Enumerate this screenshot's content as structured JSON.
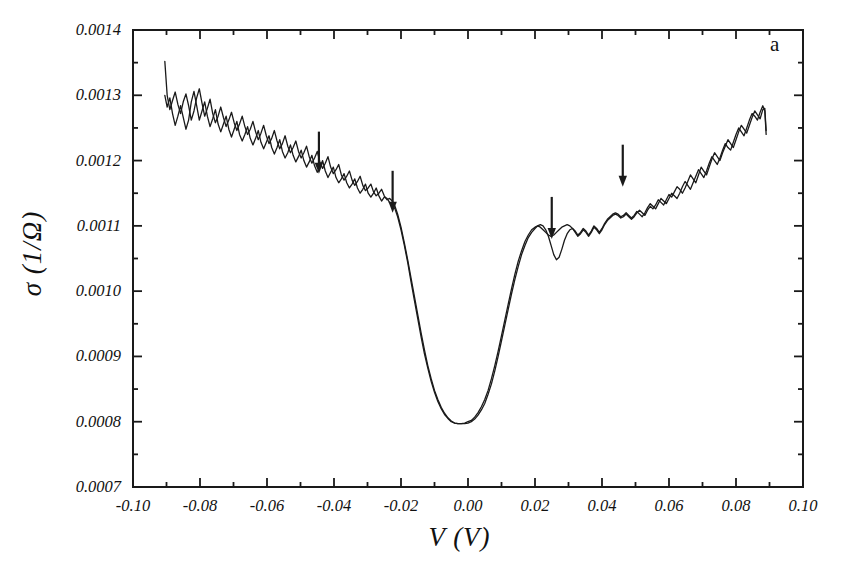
{
  "figure": {
    "panel_id": "a",
    "xlabel": "V (V)",
    "ylabel": "σ (1/Ω)",
    "line_color": "#1a1a1a",
    "background": "#ffffff"
  },
  "axes": {
    "x_ticks": [
      "-0.10",
      "-0.08",
      "-0.06",
      "-0.04",
      "-0.02",
      "0.00",
      "0.02",
      "0.04",
      "0.06",
      "0.08",
      "0.10"
    ],
    "x_tick_values": [
      -0.1,
      -0.08,
      -0.06,
      -0.04,
      -0.02,
      0.0,
      0.02,
      0.04,
      0.06,
      0.08,
      0.1
    ],
    "y_ticks": [
      "0.0007",
      "0.0008",
      "0.0009",
      "0.0010",
      "0.0011",
      "0.0012",
      "0.0013",
      "0.0014"
    ],
    "y_tick_values": [
      0.0007,
      0.0008,
      0.0009,
      0.001,
      0.0011,
      0.0012,
      0.0013,
      0.0014
    ],
    "x_minor_step": 0.01,
    "y_minor_step": 5e-05
  },
  "chart_data": {
    "type": "line",
    "title": "",
    "panel_label": "a",
    "xlabel": "V (V)",
    "ylabel": "σ (1/Ω)",
    "xlim": [
      -0.1,
      0.1
    ],
    "ylim": [
      0.0007,
      0.0014
    ],
    "grid": false,
    "legend": "none",
    "annotations": [
      {
        "type": "arrow",
        "direction": "down",
        "x": -0.0445,
        "y_tip": 0.00118,
        "label": ""
      },
      {
        "type": "arrow",
        "direction": "down",
        "x": -0.0225,
        "y_tip": 0.00112,
        "label": ""
      },
      {
        "type": "arrow",
        "direction": "down",
        "x": 0.025,
        "y_tip": 0.00108,
        "label": ""
      },
      {
        "type": "arrow",
        "direction": "down",
        "x": 0.0462,
        "y_tip": 0.00116,
        "label": ""
      }
    ],
    "series": [
      {
        "name": "trace-1",
        "x": [
          -0.0905,
          -0.0898,
          -0.089,
          -0.0882,
          -0.0874,
          -0.0866,
          -0.0858,
          -0.085,
          -0.0842,
          -0.0834,
          -0.0826,
          -0.0818,
          -0.081,
          -0.0802,
          -0.0794,
          -0.0786,
          -0.0778,
          -0.077,
          -0.0762,
          -0.0754,
          -0.0746,
          -0.0738,
          -0.073,
          -0.0722,
          -0.0714,
          -0.0706,
          -0.0698,
          -0.069,
          -0.0682,
          -0.0674,
          -0.0666,
          -0.0658,
          -0.065,
          -0.0642,
          -0.0634,
          -0.0626,
          -0.0618,
          -0.061,
          -0.0602,
          -0.0594,
          -0.0586,
          -0.0578,
          -0.057,
          -0.0562,
          -0.0554,
          -0.0546,
          -0.0538,
          -0.053,
          -0.0522,
          -0.0514,
          -0.0506,
          -0.0498,
          -0.049,
          -0.0482,
          -0.0474,
          -0.0466,
          -0.0458,
          -0.045,
          -0.0442,
          -0.0434,
          -0.0426,
          -0.0418,
          -0.041,
          -0.0402,
          -0.0394,
          -0.0386,
          -0.0378,
          -0.037,
          -0.0362,
          -0.0354,
          -0.0346,
          -0.0338,
          -0.033,
          -0.0322,
          -0.0314,
          -0.0306,
          -0.0298,
          -0.029,
          -0.0282,
          -0.0274,
          -0.0266,
          -0.0258,
          -0.025,
          -0.0242,
          -0.0234,
          -0.0226,
          -0.0218,
          -0.021,
          -0.02,
          -0.019,
          -0.018,
          -0.017,
          -0.016,
          -0.015,
          -0.014,
          -0.013,
          -0.012,
          -0.011,
          -0.01,
          -0.009,
          -0.008,
          -0.007,
          -0.006,
          -0.005,
          -0.004,
          -0.003,
          -0.002,
          -0.001,
          0.0,
          0.001,
          0.002,
          0.003,
          0.004,
          0.005,
          0.006,
          0.007,
          0.008,
          0.009,
          0.01,
          0.011,
          0.012,
          0.013,
          0.014,
          0.015,
          0.016,
          0.017,
          0.018,
          0.019,
          0.02,
          0.0208,
          0.0216,
          0.0224,
          0.0232,
          0.024,
          0.0248,
          0.0256,
          0.0264,
          0.0272,
          0.028,
          0.0288,
          0.0296,
          0.0304,
          0.0312,
          0.032,
          0.0328,
          0.0336,
          0.0344,
          0.0352,
          0.036,
          0.0368,
          0.0376,
          0.0384,
          0.0392,
          0.04,
          0.0408,
          0.0416,
          0.0424,
          0.0432,
          0.044,
          0.0448,
          0.0456,
          0.0464,
          0.0472,
          0.048,
          0.0488,
          0.0496,
          0.0504,
          0.0512,
          0.052,
          0.0528,
          0.0536,
          0.0544,
          0.0552,
          0.056,
          0.0568,
          0.0576,
          0.0584,
          0.0592,
          0.06,
          0.0608,
          0.0616,
          0.0624,
          0.0632,
          0.064,
          0.0648,
          0.0656,
          0.0664,
          0.0672,
          0.068,
          0.0688,
          0.0696,
          0.0704,
          0.0712,
          0.072,
          0.0728,
          0.0736,
          0.0744,
          0.0752,
          0.076,
          0.0768,
          0.0776,
          0.0784,
          0.0792,
          0.08,
          0.0808,
          0.0816,
          0.0824,
          0.0832,
          0.084,
          0.0848,
          0.0856,
          0.0864,
          0.0872,
          0.088,
          0.0886,
          0.089
        ],
        "y": [
          0.001352,
          0.0013,
          0.001278,
          0.001292,
          0.001305,
          0.001286,
          0.001272,
          0.00129,
          0.001302,
          0.001284,
          0.001262,
          0.001276,
          0.001296,
          0.00131,
          0.001288,
          0.001268,
          0.00128,
          0.001294,
          0.001272,
          0.001258,
          0.001268,
          0.001282,
          0.001266,
          0.001252,
          0.001262,
          0.001274,
          0.001258,
          0.001246,
          0.001256,
          0.001268,
          0.001252,
          0.00124,
          0.001248,
          0.00126,
          0.001244,
          0.001232,
          0.001242,
          0.001254,
          0.001238,
          0.001226,
          0.001234,
          0.001246,
          0.00123,
          0.001218,
          0.001226,
          0.001238,
          0.001222,
          0.001212,
          0.00122,
          0.00123,
          0.001214,
          0.001204,
          0.001212,
          0.001222,
          0.001206,
          0.001196,
          0.001204,
          0.001214,
          0.001198,
          0.001188,
          0.001196,
          0.001206,
          0.00119,
          0.00118,
          0.001186,
          0.001194,
          0.001178,
          0.00117,
          0.001176,
          0.001184,
          0.00117,
          0.001162,
          0.001168,
          0.001176,
          0.001162,
          0.001154,
          0.001158,
          0.001164,
          0.001152,
          0.001146,
          0.00115,
          0.001156,
          0.001146,
          0.00114,
          0.001142,
          0.001138,
          0.00113,
          0.001118,
          0.001098,
          0.001074,
          0.001048,
          0.00102,
          0.000992,
          0.000964,
          0.000936,
          0.00091,
          0.000886,
          0.000866,
          0.000848,
          0.000834,
          0.000822,
          0.000813,
          0.000806,
          0.000801,
          0.000798,
          0.000797,
          0.000797,
          0.000797,
          0.000798,
          0.0008,
          0.000804,
          0.00081,
          0.000818,
          0.000828,
          0.000842,
          0.000858,
          0.000878,
          0.0009,
          0.000924,
          0.000948,
          0.000972,
          0.000996,
          0.001018,
          0.001038,
          0.001056,
          0.00107,
          0.001082,
          0.00109,
          0.001096,
          0.0011,
          0.001102,
          0.0011,
          0.001094,
          0.001084,
          0.00107,
          0.001056,
          0.001048,
          0.001052,
          0.001064,
          0.001078,
          0.001088,
          0.001094,
          0.001096,
          0.001092,
          0.001086,
          0.00109,
          0.001096,
          0.001092,
          0.001086,
          0.001092,
          0.0011,
          0.001096,
          0.00109,
          0.001096,
          0.001104,
          0.00111,
          0.001114,
          0.001118,
          0.00112,
          0.001118,
          0.001114,
          0.001116,
          0.00112,
          0.001116,
          0.001112,
          0.001116,
          0.001122,
          0.001118,
          0.001114,
          0.00112,
          0.001128,
          0.001134,
          0.00113,
          0.001126,
          0.001134,
          0.001142,
          0.001138,
          0.001134,
          0.001142,
          0.00115,
          0.001146,
          0.001142,
          0.00115,
          0.00116,
          0.001168,
          0.001162,
          0.001156,
          0.001166,
          0.001176,
          0.001186,
          0.00118,
          0.001174,
          0.001184,
          0.001196,
          0.001206,
          0.0012,
          0.001194,
          0.001204,
          0.001216,
          0.001226,
          0.00122,
          0.001216,
          0.001228,
          0.00124,
          0.00125,
          0.001244,
          0.001238,
          0.00125,
          0.001262,
          0.001272,
          0.001268,
          0.001262,
          0.001274,
          0.001284,
          0.001276,
          0.00124
        ]
      },
      {
        "name": "trace-2",
        "x": [
          -0.0905,
          -0.0898,
          -0.089,
          -0.0882,
          -0.0874,
          -0.0866,
          -0.0858,
          -0.085,
          -0.0842,
          -0.0834,
          -0.0826,
          -0.0818,
          -0.081,
          -0.0802,
          -0.0794,
          -0.0786,
          -0.0778,
          -0.077,
          -0.0762,
          -0.0754,
          -0.0746,
          -0.0738,
          -0.073,
          -0.0722,
          -0.0714,
          -0.0706,
          -0.0698,
          -0.069,
          -0.0682,
          -0.0674,
          -0.0666,
          -0.0658,
          -0.065,
          -0.0642,
          -0.0634,
          -0.0626,
          -0.0618,
          -0.061,
          -0.0602,
          -0.0594,
          -0.0586,
          -0.0578,
          -0.057,
          -0.0562,
          -0.0554,
          -0.0546,
          -0.0538,
          -0.053,
          -0.0522,
          -0.0514,
          -0.0506,
          -0.0498,
          -0.049,
          -0.0482,
          -0.0474,
          -0.0466,
          -0.0458,
          -0.045,
          -0.0442,
          -0.0434,
          -0.0426,
          -0.0418,
          -0.041,
          -0.0402,
          -0.0394,
          -0.0386,
          -0.0378,
          -0.037,
          -0.0362,
          -0.0354,
          -0.0346,
          -0.0338,
          -0.033,
          -0.0322,
          -0.0314,
          -0.0306,
          -0.0298,
          -0.029,
          -0.0282,
          -0.0274,
          -0.0266,
          -0.0258,
          -0.025,
          -0.0242,
          -0.0234,
          -0.0226,
          -0.0218,
          -0.021,
          -0.02,
          -0.019,
          -0.018,
          -0.017,
          -0.016,
          -0.015,
          -0.014,
          -0.013,
          -0.012,
          -0.011,
          -0.01,
          -0.009,
          -0.008,
          -0.007,
          -0.006,
          -0.005,
          -0.004,
          -0.003,
          -0.002,
          -0.001,
          0.0,
          0.001,
          0.002,
          0.003,
          0.004,
          0.005,
          0.006,
          0.007,
          0.008,
          0.009,
          0.01,
          0.011,
          0.012,
          0.013,
          0.014,
          0.015,
          0.016,
          0.017,
          0.018,
          0.019,
          0.02,
          0.0208,
          0.0216,
          0.0224,
          0.0232,
          0.024,
          0.0248,
          0.0256,
          0.0264,
          0.0272,
          0.028,
          0.0288,
          0.0296,
          0.0304,
          0.0312,
          0.032,
          0.0328,
          0.0336,
          0.0344,
          0.0352,
          0.036,
          0.0368,
          0.0376,
          0.0384,
          0.0392,
          0.04,
          0.0408,
          0.0416,
          0.0424,
          0.0432,
          0.044,
          0.0448,
          0.0456,
          0.0464,
          0.0472,
          0.048,
          0.0488,
          0.0496,
          0.0504,
          0.0512,
          0.052,
          0.0528,
          0.0536,
          0.0544,
          0.0552,
          0.056,
          0.0568,
          0.0576,
          0.0584,
          0.0592,
          0.06,
          0.0608,
          0.0616,
          0.0624,
          0.0632,
          0.064,
          0.0648,
          0.0656,
          0.0664,
          0.0672,
          0.068,
          0.0688,
          0.0696,
          0.0704,
          0.0712,
          0.072,
          0.0728,
          0.0736,
          0.0744,
          0.0752,
          0.076,
          0.0768,
          0.0776,
          0.0784,
          0.0792,
          0.08,
          0.0808,
          0.0816,
          0.0824,
          0.0832,
          0.084,
          0.0848,
          0.0856,
          0.0864,
          0.0872,
          0.088,
          0.0886,
          0.089
        ],
        "y": [
          0.0013,
          0.001282,
          0.001296,
          0.001272,
          0.001254,
          0.001268,
          0.001284,
          0.001266,
          0.001248,
          0.001262,
          0.00129,
          0.001306,
          0.001284,
          0.001262,
          0.001276,
          0.00129,
          0.001268,
          0.001252,
          0.001264,
          0.001278,
          0.001256,
          0.001244,
          0.001256,
          0.001268,
          0.001248,
          0.001236,
          0.001248,
          0.00126,
          0.00124,
          0.00123,
          0.00124,
          0.001252,
          0.001234,
          0.001224,
          0.001234,
          0.001246,
          0.001228,
          0.001218,
          0.001228,
          0.001238,
          0.00122,
          0.00121,
          0.00122,
          0.001232,
          0.001214,
          0.001204,
          0.001212,
          0.001224,
          0.001208,
          0.001198,
          0.001206,
          0.001216,
          0.0012,
          0.00119,
          0.001198,
          0.001208,
          0.001192,
          0.001182,
          0.00119,
          0.0012,
          0.001184,
          0.001174,
          0.001182,
          0.00119,
          0.001174,
          0.001166,
          0.001172,
          0.00118,
          0.001166,
          0.001158,
          0.001164,
          0.001172,
          0.001158,
          0.00115,
          0.001156,
          0.001164,
          0.00115,
          0.001144,
          0.00115,
          0.001158,
          0.001146,
          0.001138,
          0.001144,
          0.001142,
          0.001136,
          0.001132,
          0.001126,
          0.001114,
          0.001094,
          0.00107,
          0.001044,
          0.001014,
          0.000986,
          0.000958,
          0.00093,
          0.000904,
          0.000882,
          0.000862,
          0.000845,
          0.000831,
          0.00082,
          0.000811,
          0.000805,
          0.0008,
          0.000798,
          0.000797,
          0.000797,
          0.000798,
          0.0008,
          0.000802,
          0.000807,
          0.000814,
          0.000823,
          0.000834,
          0.000848,
          0.000866,
          0.000886,
          0.000908,
          0.000932,
          0.000956,
          0.00098,
          0.001004,
          0.001026,
          0.001046,
          0.001062,
          0.001076,
          0.001086,
          0.001094,
          0.001098,
          0.0011,
          0.001098,
          0.001094,
          0.00109,
          0.001086,
          0.001084,
          0.001086,
          0.00109,
          0.001094,
          0.001098,
          0.0011,
          0.001102,
          0.0011,
          0.001096,
          0.00109,
          0.001084,
          0.001088,
          0.001094,
          0.00109,
          0.001084,
          0.00109,
          0.001098,
          0.001094,
          0.001088,
          0.001094,
          0.001102,
          0.001108,
          0.001112,
          0.001116,
          0.001118,
          0.001116,
          0.001112,
          0.001114,
          0.001118,
          0.001114,
          0.00111,
          0.001114,
          0.00112,
          0.001124,
          0.00112,
          0.001116,
          0.001124,
          0.00113,
          0.001126,
          0.001132,
          0.00114,
          0.001136,
          0.001132,
          0.00114,
          0.001148,
          0.001144,
          0.001152,
          0.00116,
          0.001156,
          0.00115,
          0.001158,
          0.001168,
          0.001178,
          0.001172,
          0.001166,
          0.001178,
          0.00119,
          0.001184,
          0.001178,
          0.00119,
          0.001202,
          0.001212,
          0.001206,
          0.0012,
          0.001212,
          0.001222,
          0.001232,
          0.001226,
          0.00122,
          0.001232,
          0.001244,
          0.001254,
          0.001248,
          0.001242,
          0.001254,
          0.001266,
          0.001276,
          0.00127,
          0.001264,
          0.001278,
          0.00128,
          0.001246
        ]
      }
    ]
  }
}
